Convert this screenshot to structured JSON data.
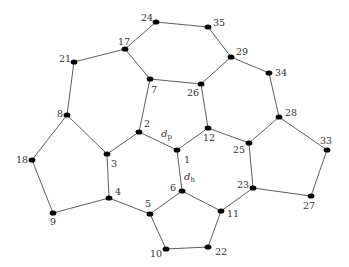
{
  "diagram": {
    "type": "graph",
    "nodes": [
      {
        "id": "1",
        "x": 177,
        "y": 150,
        "lx": 184,
        "ly": 163
      },
      {
        "id": "2",
        "x": 139,
        "y": 132,
        "lx": 144,
        "ly": 127
      },
      {
        "id": "3",
        "x": 107,
        "y": 154,
        "lx": 111,
        "ly": 167
      },
      {
        "id": "4",
        "x": 109,
        "y": 198,
        "lx": 115,
        "ly": 195
      },
      {
        "id": "5",
        "x": 150,
        "y": 214,
        "lx": 145,
        "ly": 207
      },
      {
        "id": "6",
        "x": 182,
        "y": 191,
        "lx": 170,
        "ly": 191
      },
      {
        "id": "7",
        "x": 150,
        "y": 79,
        "lx": 151,
        "ly": 93
      },
      {
        "id": "8",
        "x": 67,
        "y": 115,
        "lx": 57,
        "ly": 117
      },
      {
        "id": "9",
        "x": 53,
        "y": 213,
        "lx": 50,
        "ly": 225
      },
      {
        "id": "10",
        "x": 166,
        "y": 249,
        "lx": 150,
        "ly": 257
      },
      {
        "id": "11",
        "x": 221,
        "y": 211,
        "lx": 227,
        "ly": 217
      },
      {
        "id": "12",
        "x": 208,
        "y": 128,
        "lx": 203,
        "ly": 141
      },
      {
        "id": "17",
        "x": 125,
        "y": 49,
        "lx": 118,
        "ly": 45
      },
      {
        "id": "18",
        "x": 32,
        "y": 160,
        "lx": 16,
        "ly": 163
      },
      {
        "id": "21",
        "x": 74,
        "y": 62,
        "lx": 59,
        "ly": 62
      },
      {
        "id": "22",
        "x": 208,
        "y": 247,
        "lx": 215,
        "ly": 255
      },
      {
        "id": "23",
        "x": 253,
        "y": 188,
        "lx": 237,
        "ly": 188
      },
      {
        "id": "24",
        "x": 156,
        "y": 22,
        "lx": 141,
        "ly": 21
      },
      {
        "id": "25",
        "x": 249,
        "y": 143,
        "lx": 233,
        "ly": 153
      },
      {
        "id": "26",
        "x": 201,
        "y": 84,
        "lx": 187,
        "ly": 96
      },
      {
        "id": "27",
        "x": 311,
        "y": 196,
        "lx": 303,
        "ly": 209
      },
      {
        "id": "28",
        "x": 279,
        "y": 117,
        "lx": 285,
        "ly": 116
      },
      {
        "id": "29",
        "x": 231,
        "y": 57,
        "lx": 236,
        "ly": 55
      },
      {
        "id": "33",
        "x": 327,
        "y": 150,
        "lx": 320,
        "ly": 144
      },
      {
        "id": "34",
        "x": 269,
        "y": 73,
        "lx": 275,
        "ly": 76
      },
      {
        "id": "35",
        "x": 208,
        "y": 27,
        "lx": 213,
        "ly": 26
      }
    ],
    "edges": [
      [
        "24",
        "35"
      ],
      [
        "24",
        "17"
      ],
      [
        "35",
        "29"
      ],
      [
        "17",
        "21"
      ],
      [
        "17",
        "7"
      ],
      [
        "29",
        "26"
      ],
      [
        "29",
        "34"
      ],
      [
        "21",
        "8"
      ],
      [
        "7",
        "26"
      ],
      [
        "7",
        "2"
      ],
      [
        "26",
        "12"
      ],
      [
        "34",
        "28"
      ],
      [
        "8",
        "18"
      ],
      [
        "8",
        "3"
      ],
      [
        "2",
        "3"
      ],
      [
        "2",
        "1"
      ],
      [
        "12",
        "1"
      ],
      [
        "12",
        "25"
      ],
      [
        "28",
        "25"
      ],
      [
        "28",
        "33"
      ],
      [
        "18",
        "9"
      ],
      [
        "3",
        "4"
      ],
      [
        "9",
        "4"
      ],
      [
        "4",
        "5"
      ],
      [
        "1",
        "6"
      ],
      [
        "6",
        "5"
      ],
      [
        "6",
        "11"
      ],
      [
        "25",
        "23"
      ],
      [
        "33",
        "27"
      ],
      [
        "23",
        "27"
      ],
      [
        "23",
        "11"
      ],
      [
        "5",
        "10"
      ],
      [
        "11",
        "22"
      ],
      [
        "10",
        "22"
      ]
    ],
    "annotations": [
      {
        "id": "dp",
        "main": "d",
        "sub": "p",
        "x": 161,
        "y": 137
      },
      {
        "id": "dh",
        "main": "d",
        "sub": "h",
        "x": 184,
        "y": 180
      }
    ]
  }
}
